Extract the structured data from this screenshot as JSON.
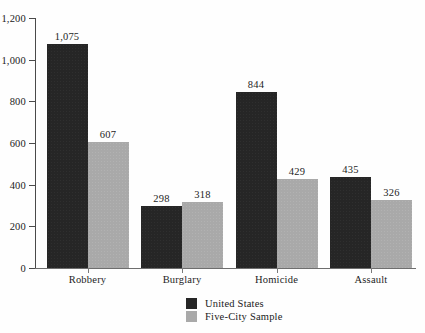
{
  "chart_data": {
    "type": "bar",
    "title": "",
    "subtitle": "",
    "xlabel": "",
    "ylabel": "",
    "categories": [
      "Robbery",
      "Burglary",
      "Homicide",
      "Assault"
    ],
    "series": [
      {
        "name": "United States",
        "color": "#262626",
        "values": [
          1075,
          298,
          844,
          435
        ],
        "labels": [
          "1,075",
          "298",
          "844",
          "435"
        ]
      },
      {
        "name": "Five-City Sample",
        "color": "#a9a9a9",
        "values": [
          607,
          318,
          429,
          326
        ],
        "labels": [
          "607",
          "318",
          "429",
          "326"
        ]
      }
    ],
    "ylim": [
      0,
      1200
    ],
    "ytick_values": [
      0,
      200,
      400,
      600,
      800,
      1000,
      1200
    ],
    "ytick_labels": [
      "0",
      "200",
      "400",
      "600",
      "800",
      "1,000",
      "1,200"
    ],
    "grid": false,
    "legend_position": "bottom-center",
    "legend": [
      "United States",
      "Five-City Sample"
    ]
  },
  "axes": {
    "y_axis_name": "y-axis",
    "x_axis_name": "x-axis"
  }
}
